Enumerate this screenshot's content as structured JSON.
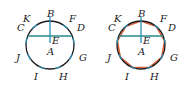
{
  "figures": [
    {
      "id": "left",
      "labels": {
        "B": "B",
        "F": "F",
        "K": "K",
        "C": "C",
        "D": "D",
        "E": "E",
        "A": "A",
        "J": "J",
        "G": "G",
        "I": "I",
        "H": "H"
      },
      "shows_polygon": false
    },
    {
      "id": "right",
      "labels": {
        "B": "B",
        "F": "F",
        "K": "K",
        "C": "C",
        "D": "D",
        "E": "E",
        "A": "A",
        "J": "J",
        "G": "G",
        "I": "I",
        "H": "H"
      },
      "shows_polygon": true
    }
  ],
  "colors": {
    "circle": "#1a1a1a",
    "construction": "#2a8fb8",
    "chord": "#2a8a8a",
    "polygon": "#d9603b"
  }
}
